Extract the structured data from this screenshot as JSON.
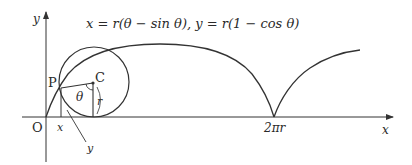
{
  "diagram": {
    "equation": "x = r(θ − sin θ),  y = r(1 − cos θ)",
    "axes": {
      "x_label": "x",
      "y_label": "y",
      "origin_label": "O"
    },
    "points": {
      "P": "P",
      "C": "C"
    },
    "annotations": {
      "theta": "θ",
      "radius": "r",
      "x_coord": "x",
      "y_coord": "y",
      "cusp": "2πr"
    },
    "colors": {
      "stroke": "#333333",
      "text": "#2a2a2a",
      "background": "#ffffff"
    }
  }
}
